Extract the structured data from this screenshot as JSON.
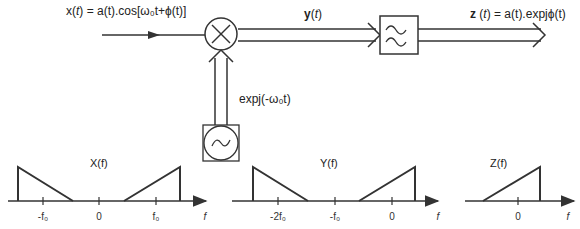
{
  "signals": {
    "input": {
      "name": "x",
      "arg": "t",
      "expr": "= a(t).cos[ω₀t+ϕ(t)]"
    },
    "mixer_output": {
      "name": "y",
      "arg": "t"
    },
    "output": {
      "name": "z",
      "arg": "t",
      "expr": "= a(t).expjϕ(t)"
    },
    "oscillator": {
      "expr": "expj(-ω₀t)"
    }
  },
  "blocks": {
    "mixer": "multiplier-icon",
    "filter": "lowpass-filter-icon",
    "oscillator": "oscillator-icon"
  },
  "spectra": [
    {
      "title": "X(f)",
      "ticks": [
        "-f₀",
        "0",
        "f₀"
      ],
      "axis": "f"
    },
    {
      "title": "Y(f)",
      "ticks": [
        "-2f₀",
        "-f₀",
        "0"
      ],
      "axis": "f"
    },
    {
      "title": "Z(f)",
      "ticks": [
        "0"
      ],
      "axis": "f"
    }
  ]
}
